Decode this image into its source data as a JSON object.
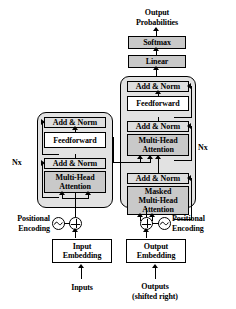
{
  "diagram": {
    "colors": {
      "stack_fill": "#e2e2e2",
      "attention_fill": "#c9c9c9",
      "softmax_fill": "#c9c9c9",
      "linear_fill": "#c9c9c9",
      "addnorm_fill": "#dedede",
      "line": "#000000",
      "background": "#ffffff"
    }
  },
  "top": {
    "output_probabilities": "Output\nProbabilities",
    "softmax": "Softmax",
    "linear": "Linear"
  },
  "encoder": {
    "repeat_label": "Nx",
    "blocks": {
      "add_norm_top": "Add & Norm",
      "feedforward": "Feedforward",
      "add_norm_bottom": "Add & Norm",
      "multi_head_attention": "Multi-Head\nAttention"
    },
    "positional_encoding": "Positional\nEncoding",
    "embedding": "Input\nEmbedding",
    "input_label": "Inputs"
  },
  "decoder": {
    "repeat_label": "Nx",
    "blocks": {
      "add_norm_top": "Add & Norm",
      "feedforward": "Feedforward",
      "add_norm_mid": "Add & Norm",
      "multi_head_attention": "Multi-Head\nAttention",
      "add_norm_bottom": "Add & Norm",
      "masked_multi_head_attention": "Masked\nMulti-Head\nAttention"
    },
    "positional_encoding": "Positional\nEncoding",
    "embedding": "Output\nEmbedding",
    "input_label": "Outputs\n(shifted right)"
  },
  "icons": {
    "plus_circle": "circled-plus-icon",
    "sine_circle": "sine-wave-circle-icon"
  }
}
